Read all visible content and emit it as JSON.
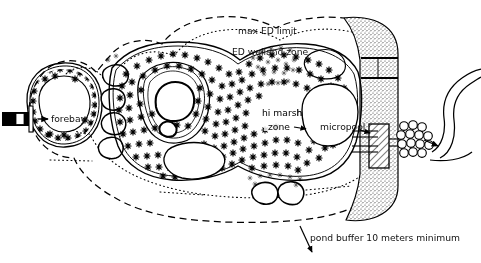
{
  "figure": {
    "type": "plan-view-diagram",
    "background_color": "#ffffff",
    "line_color": "#000000",
    "text_color": "#111111"
  },
  "labels": {
    "max_ed_limit": "max ED limit",
    "ed_wetland_zone": "ED welland zone",
    "hi_marsh_zone_line1": "hi marsh",
    "hi_marsh_zone_line2": "zone",
    "forebay": "forebay",
    "micropool": "micropool",
    "pond_buffer": "pond buffer 10 meters minimum"
  },
  "features": {
    "inlet_pipe": "inlet-pipe",
    "rock_berm": "rock-berm-boulders",
    "shoreline_boulders": "shoreline-boulders",
    "embankment": "stippled-earth-embankment",
    "spillway": "emergency-spillway",
    "outlet_riser": "hatched-outlet-riser",
    "outlet_pipes": "outlet-barrel-pipes",
    "riprap_apron": "riprap-outfall-apron",
    "stream_channel": "receiving-stream-channel",
    "flow_arrow_inlet": "inflow-arrow",
    "flow_arrow_outlet": "outflow-arrow",
    "buffer_leader_arrow": "buffer-leader-arrow"
  },
  "boundaries": {
    "pond_buffer_line_style": "dashed",
    "max_ed_limit_line_style": "dotted",
    "permanent_pool_line_style": "solid"
  }
}
